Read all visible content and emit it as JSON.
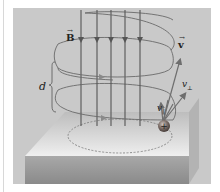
{
  "figure": {
    "background_color": "#c9c9c9",
    "labels": {
      "magnetic_field": "B",
      "velocity": "v",
      "v_perpendicular": "v",
      "v_perpendicular_sub": "⊥",
      "v_parallel": "v",
      "v_parallel_sub": "∥",
      "pitch": "d",
      "vector_arrow": "→",
      "charge_sign": "+"
    },
    "field_lines": {
      "count": 5,
      "direction": "down",
      "color": "#555555"
    },
    "helix": {
      "turns_visible": 3,
      "color": "#6a6a6a"
    },
    "platform": {
      "top_color": "#e6e6e6",
      "side_color": "#9a9a9a"
    },
    "particle": {
      "charge": "positive",
      "color": "#7a6a64"
    }
  }
}
